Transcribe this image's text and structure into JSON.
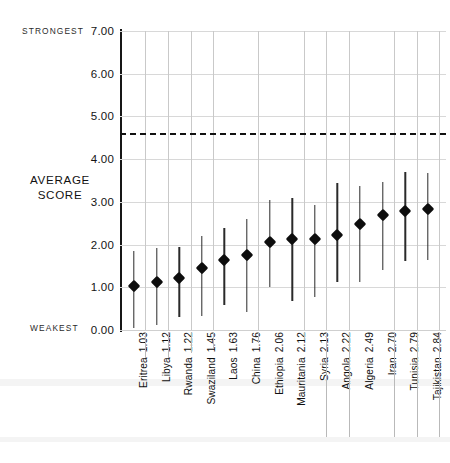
{
  "chart_data": {
    "type": "scatter",
    "title": "",
    "subtitle": "",
    "xlabel": "",
    "ylabel": "AVERAGE SCORE",
    "ylim": [
      0.0,
      7.0
    ],
    "yticks": [
      "0.00",
      "1.00",
      "2.00",
      "3.00",
      "4.00",
      "5.00",
      "6.00",
      "7.00"
    ],
    "ytick_values": [
      0,
      1,
      2,
      3,
      4,
      5,
      6,
      7
    ],
    "grid": true,
    "legend": "none",
    "axis_endpoint_labels": {
      "top": "STRONGEST",
      "bottom": "WEAKEST"
    },
    "reference_line": {
      "label": "",
      "value": 4.62,
      "style": "dashed",
      "color": "#111111"
    },
    "categories": [
      "Eritrea",
      "Libya",
      "Rwanda",
      "Swaziland",
      "Laos",
      "China",
      "Ethiopia",
      "Mauritania",
      "Syria",
      "Angola",
      "Algeria",
      "Iran",
      "Tunisia",
      "Tajikistan"
    ],
    "values": [
      1.03,
      1.12,
      1.22,
      1.45,
      1.63,
      1.76,
      2.06,
      2.12,
      2.13,
      2.22,
      2.49,
      2.7,
      2.79,
      2.84
    ],
    "error_low": [
      0.05,
      0.12,
      0.3,
      0.33,
      0.58,
      0.43,
      1.0,
      0.67,
      0.77,
      1.13,
      1.12,
      1.4,
      1.62,
      1.63
    ],
    "error_high": [
      1.85,
      1.92,
      1.95,
      2.2,
      2.38,
      2.6,
      3.05,
      3.08,
      2.92,
      3.45,
      3.37,
      3.47,
      3.7,
      3.67
    ],
    "points": [
      {
        "category": "Eritrea",
        "value": 1.03,
        "low": 0.05,
        "high": 1.85,
        "tick_label": "Eritrea 1.03"
      },
      {
        "category": "Libya",
        "value": 1.12,
        "low": 0.12,
        "high": 1.92,
        "tick_label": "Libya 1.12"
      },
      {
        "category": "Rwanda",
        "value": 1.22,
        "low": 0.3,
        "high": 1.95,
        "tick_label": "Rwanda 1.22"
      },
      {
        "category": "Swaziland",
        "value": 1.45,
        "low": 0.33,
        "high": 2.2,
        "tick_label": "Swaziland 1.45"
      },
      {
        "category": "Laos",
        "value": 1.63,
        "low": 0.58,
        "high": 2.38,
        "tick_label": "Laos 1.63"
      },
      {
        "category": "China",
        "value": 1.76,
        "low": 0.43,
        "high": 2.6,
        "tick_label": "China 1.76"
      },
      {
        "category": "Ethiopia",
        "value": 2.06,
        "low": 1.0,
        "high": 3.05,
        "tick_label": "Ethiopia 2.06"
      },
      {
        "category": "Mauritania",
        "value": 2.12,
        "low": 0.67,
        "high": 3.08,
        "tick_label": "Mauritania 2.12"
      },
      {
        "category": "Syria",
        "value": 2.13,
        "low": 0.77,
        "high": 2.92,
        "tick_label": "Syria 2.13"
      },
      {
        "category": "Angola",
        "value": 2.22,
        "low": 1.13,
        "high": 3.45,
        "tick_label": "Angola 2.22"
      },
      {
        "category": "Algeria",
        "value": 2.49,
        "low": 1.12,
        "high": 3.37,
        "tick_label": "Algeria 2.49"
      },
      {
        "category": "Iran",
        "value": 2.7,
        "low": 1.4,
        "high": 3.47,
        "tick_label": "Iran 2.70"
      },
      {
        "category": "Tunisia",
        "value": 2.79,
        "low": 1.62,
        "high": 3.7,
        "tick_label": "Tunisia 2.79"
      },
      {
        "category": "Tajikistan",
        "value": 2.84,
        "low": 1.63,
        "high": 3.67,
        "tick_label": "Tajikistan 2.84"
      }
    ],
    "colors": {
      "marker": "#0d0d0d",
      "errorbar": "#2a2a2a",
      "grid": "#d8d8d8",
      "axis": "#161616",
      "reference": "#111111"
    }
  }
}
